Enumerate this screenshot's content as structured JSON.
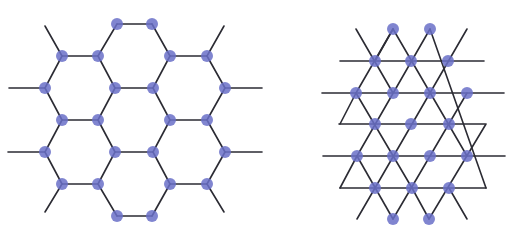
{
  "colors": {
    "bond": "#2b2b33",
    "atom": "#6a70c8",
    "background": "#ffffff"
  },
  "diagrams": [
    {
      "name": "honeycomb-lattice",
      "atom_radius": 6,
      "atoms": [
        [
          117,
          24
        ],
        [
          152,
          24
        ],
        [
          62,
          56
        ],
        [
          98,
          56
        ],
        [
          170,
          56
        ],
        [
          207,
          56
        ],
        [
          45,
          88
        ],
        [
          115,
          88
        ],
        [
          153,
          88
        ],
        [
          225,
          88
        ],
        [
          62,
          120
        ],
        [
          98,
          120
        ],
        [
          170,
          120
        ],
        [
          207,
          120
        ],
        [
          45,
          152
        ],
        [
          115,
          152
        ],
        [
          153,
          152
        ],
        [
          225,
          152
        ],
        [
          62,
          184
        ],
        [
          98,
          184
        ],
        [
          170,
          184
        ],
        [
          207,
          184
        ],
        [
          117,
          216
        ],
        [
          152,
          216
        ]
      ],
      "bonds": [
        [
          117,
          24,
          152,
          24
        ],
        [
          117,
          24,
          98,
          56
        ],
        [
          152,
          24,
          170,
          56
        ],
        [
          62,
          56,
          98,
          56
        ],
        [
          170,
          56,
          207,
          56
        ],
        [
          62,
          56,
          45,
          88
        ],
        [
          98,
          56,
          115,
          88
        ],
        [
          170,
          56,
          153,
          88
        ],
        [
          207,
          56,
          225,
          88
        ],
        [
          115,
          88,
          153,
          88
        ],
        [
          45,
          88,
          62,
          120
        ],
        [
          115,
          88,
          98,
          120
        ],
        [
          153,
          88,
          170,
          120
        ],
        [
          225,
          88,
          207,
          120
        ],
        [
          62,
          120,
          98,
          120
        ],
        [
          170,
          120,
          207,
          120
        ],
        [
          62,
          120,
          45,
          152
        ],
        [
          98,
          120,
          115,
          152
        ],
        [
          170,
          120,
          153,
          152
        ],
        [
          207,
          120,
          225,
          152
        ],
        [
          115,
          152,
          153,
          152
        ],
        [
          45,
          152,
          62,
          184
        ],
        [
          115,
          152,
          98,
          184
        ],
        [
          153,
          152,
          170,
          184
        ],
        [
          225,
          152,
          207,
          184
        ],
        [
          62,
          184,
          98,
          184
        ],
        [
          170,
          184,
          207,
          184
        ],
        [
          98,
          184,
          117,
          216
        ],
        [
          170,
          184,
          152,
          216
        ],
        [
          117,
          216,
          152,
          216
        ],
        [
          62,
          56,
          45,
          26
        ],
        [
          207,
          56,
          224,
          26
        ],
        [
          45,
          88,
          9,
          88
        ],
        [
          225,
          88,
          262,
          88
        ],
        [
          45,
          152,
          8,
          152
        ],
        [
          225,
          152,
          262,
          152
        ],
        [
          62,
          184,
          45,
          212
        ],
        [
          207,
          184,
          224,
          212
        ]
      ]
    },
    {
      "name": "triangular-lattice",
      "atom_radius": 6,
      "atoms": [
        [
          393,
          29
        ],
        [
          430,
          29
        ],
        [
          375,
          61
        ],
        [
          411,
          61
        ],
        [
          448,
          61
        ],
        [
          356,
          93
        ],
        [
          393,
          93
        ],
        [
          430,
          93
        ],
        [
          467,
          93
        ],
        [
          375,
          124
        ],
        [
          411,
          124
        ],
        [
          449,
          124
        ],
        [
          357,
          156
        ],
        [
          393,
          156
        ],
        [
          430,
          156
        ],
        [
          467,
          156
        ],
        [
          375,
          188
        ],
        [
          412,
          188
        ],
        [
          449,
          188
        ],
        [
          393,
          219
        ],
        [
          429,
          219
        ]
      ],
      "bonds": [
        [
          340,
          61,
          484,
          61
        ],
        [
          322,
          93,
          504,
          93
        ],
        [
          339,
          124,
          485,
          124
        ],
        [
          323,
          156,
          505,
          156
        ],
        [
          340,
          188,
          486,
          188
        ],
        [
          356,
          29,
          393,
          93
        ],
        [
          393,
          29,
          467,
          156
        ],
        [
          430,
          29,
          486,
          188
        ],
        [
          356,
          93,
          412,
          188
        ],
        [
          357,
          156,
          393,
          219
        ],
        [
          393,
          29,
          356,
          93
        ],
        [
          430,
          29,
          357,
          156
        ],
        [
          467,
          29,
          375,
          188
        ],
        [
          467,
          93,
          393,
          219
        ],
        [
          486,
          124,
          429,
          219
        ],
        [
          375,
          188,
          357,
          219
        ],
        [
          449,
          188,
          467,
          219
        ],
        [
          412,
          188,
          429,
          219
        ],
        [
          393,
          29,
          375,
          61
        ],
        [
          356,
          93,
          340,
          124
        ],
        [
          357,
          156,
          340,
          188
        ]
      ]
    }
  ]
}
